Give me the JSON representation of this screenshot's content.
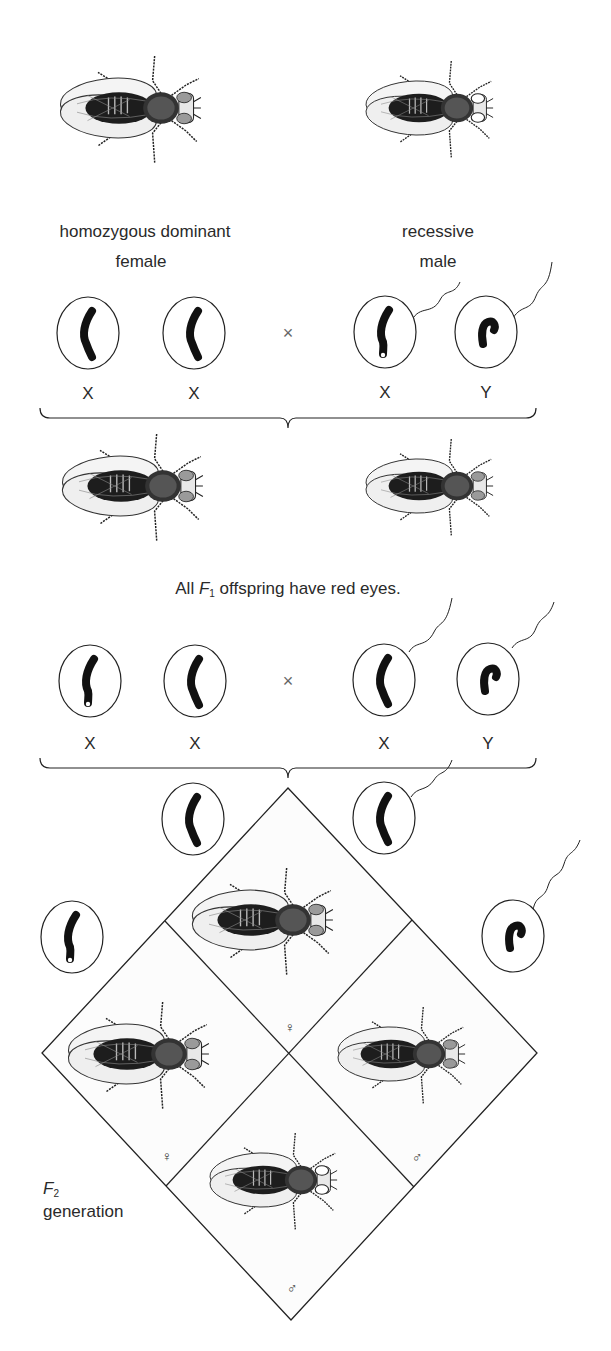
{
  "parents": {
    "female_label_line1": "homozygous dominant",
    "female_label_line2": "female",
    "male_label_line1": "recessive",
    "male_label_line2": "male",
    "cross_symbol": "×",
    "gametes": [
      "X",
      "X",
      "X",
      "Y"
    ]
  },
  "f1": {
    "caption_prefix": "All ",
    "caption_italic": "F",
    "caption_sub": "1",
    "caption_suffix": " offspring have red eyes.",
    "cross_symbol": "×",
    "gametes": [
      "X",
      "X",
      "X",
      "Y"
    ]
  },
  "punnett": {
    "cells": [
      {
        "position": "top",
        "sex_symbol": "♀",
        "eye": "red"
      },
      {
        "position": "left",
        "sex_symbol": "♀",
        "eye": "red"
      },
      {
        "position": "right",
        "sex_symbol": "♂",
        "eye": "red"
      },
      {
        "position": "bottom",
        "sex_symbol": "♂",
        "eye": "white"
      }
    ],
    "label_italic": "F",
    "label_sub": "2",
    "label_line2": "generation"
  },
  "colors": {
    "line": "#1a1a1a",
    "red_eye": "#9a9a9a",
    "white_eye": "#ffffff",
    "chromosome": "#111111"
  }
}
